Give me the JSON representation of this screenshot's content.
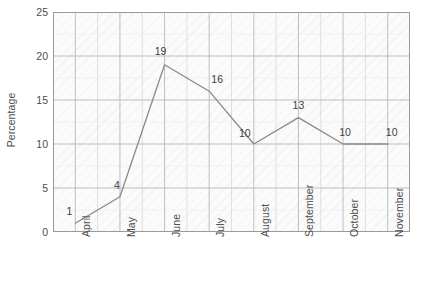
{
  "chart_data": {
    "type": "line",
    "title": "",
    "xlabel": "",
    "ylabel": "Percentage",
    "categories": [
      "April",
      "May",
      "June",
      "July",
      "August",
      "September",
      "October",
      "November"
    ],
    "values": [
      1,
      4,
      19,
      16,
      10,
      13,
      10,
      10
    ],
    "point_labels": [
      "1",
      "4",
      "19",
      "16",
      "10",
      "13",
      "10",
      "10"
    ],
    "ylim": [
      0,
      25
    ],
    "y_ticks": [
      0,
      5,
      10,
      15,
      20,
      25
    ],
    "y_tick_labels": [
      "0",
      "5",
      "10",
      "15",
      "20",
      "25"
    ],
    "grid": true,
    "minor_grid": true,
    "legend": "none",
    "series": [
      {
        "name": "Percentage",
        "values": [
          1,
          4,
          19,
          16,
          10,
          13,
          10,
          10
        ]
      }
    ]
  },
  "style": {
    "line_color": "#8a8a8a",
    "grid_major_color": "#b0b0b0",
    "grid_minor_color": "#d8d8d8",
    "axis_color": "#9a9a9a",
    "plot_background": "#fbfbfb",
    "page_background": "#ffffff",
    "label_color": "#4d4d4d",
    "value_label_color": "#3d3d3d"
  }
}
